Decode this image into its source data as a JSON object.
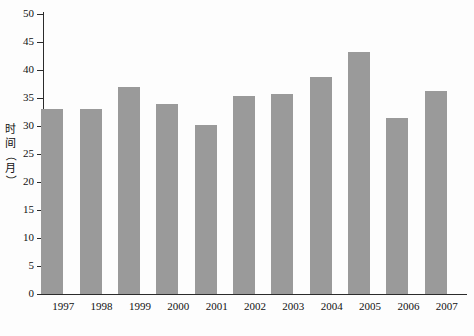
{
  "chart_data": {
    "type": "bar",
    "title": "",
    "xlabel": "",
    "ylabel": "时间（月）",
    "ylabel_chars": [
      "时",
      "间",
      "（",
      "月",
      "）"
    ],
    "categories": [
      "1997",
      "1998",
      "1999",
      "2000",
      "2001",
      "2002",
      "2003",
      "2004",
      "2005",
      "2006",
      "2007"
    ],
    "values": [
      33.0,
      33.0,
      37.0,
      33.9,
      30.2,
      35.4,
      35.7,
      38.7,
      43.2,
      31.5,
      36.3
    ],
    "ylim": [
      0,
      50
    ],
    "ytick_values": [
      0,
      5,
      10,
      15,
      20,
      25,
      30,
      35,
      40,
      45,
      50
    ],
    "ytick_labels": [
      "0",
      "5",
      "10",
      "15",
      "20",
      "25",
      "30",
      "35",
      "40",
      "45",
      "50"
    ],
    "ytick_step": 5,
    "grid": false,
    "legend": null,
    "legend_position": "none",
    "series_name": "",
    "bar_color": "#9a9a9a",
    "axis_color": "#2b2b2b",
    "background_color": "#fdfdfd"
  }
}
